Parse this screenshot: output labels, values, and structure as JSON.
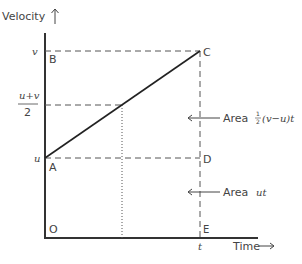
{
  "diagram": {
    "y_axis_label": "Velocity",
    "x_axis_label": "Time",
    "y_ticks": {
      "v": "v",
      "mid_numerator": "u+v",
      "mid_denominator": "2",
      "u": "u"
    },
    "x_ticks": {
      "t": "t"
    },
    "points": {
      "O": "O",
      "A": "A",
      "B": "B",
      "C": "C",
      "D": "D",
      "E": "E"
    },
    "annotations": {
      "triangle_area_prefix": "Area",
      "triangle_area_half": "1",
      "triangle_area_half_den": "2",
      "triangle_area_expr": "(v−u)t",
      "rectangle_area_prefix": "Area",
      "rectangle_area_expr": "ut"
    },
    "colors": {
      "axis": "#333333",
      "line": "#222222",
      "dashed": "#555555",
      "text": "#444444"
    }
  }
}
